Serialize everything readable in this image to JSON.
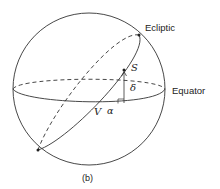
{
  "diagram": {
    "labels": {
      "ecliptic": "Ecliptic",
      "equator": "Equator",
      "star": "S",
      "vernal_point": "V",
      "right_ascension": "α",
      "declination": "δ",
      "caption": "(b)"
    },
    "colors": {
      "stroke": "#333333",
      "text": "#222222",
      "background": "#ffffff"
    }
  }
}
